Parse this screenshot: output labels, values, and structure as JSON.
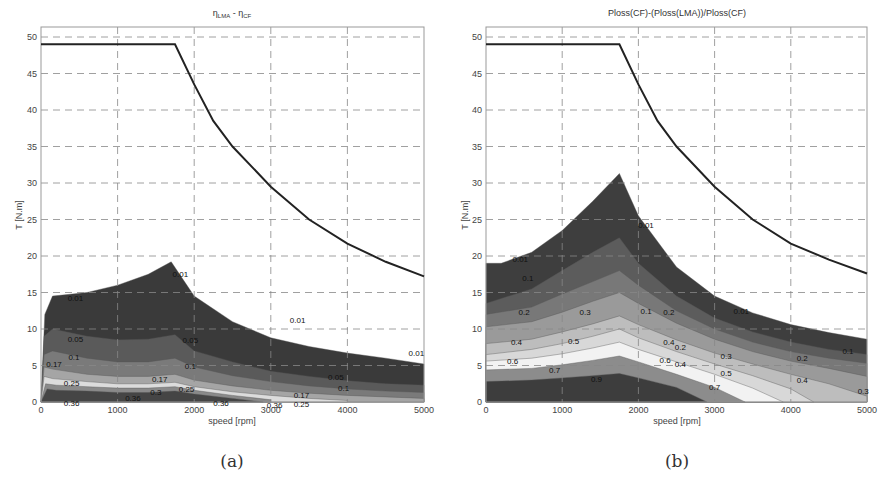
{
  "chart_data": [
    {
      "id": "a",
      "type": "contour",
      "caption": "(a)",
      "title": "η_LMA - η_CF",
      "title_main": "η",
      "title_sub1": "LMA",
      "title_mid": " - η",
      "title_sub2": "CF",
      "xlabel": "speed [rpm]",
      "ylabel": "T [N.m]",
      "xlim": [
        0,
        5000
      ],
      "ylim": [
        0,
        52
      ],
      "xticks": [
        0,
        1000,
        2000,
        3000,
        4000,
        5000
      ],
      "yticks": [
        0,
        5,
        10,
        15,
        20,
        25,
        30,
        35,
        40,
        45,
        50
      ],
      "grid": true,
      "torque_limit": {
        "speed": [
          0,
          1750,
          2000,
          2250,
          2500,
          3000,
          3500,
          4000,
          4500,
          5000
        ],
        "torque": [
          49,
          49,
          43.5,
          38.5,
          35,
          29.5,
          25,
          21.7,
          19.2,
          17.2
        ]
      },
      "levels": [
        0.01,
        0.05,
        0.1,
        0.17,
        0.25,
        0.3,
        0.36
      ],
      "bands": [
        {
          "level": 0.01,
          "color": "#3a3a3a",
          "speed": [
            0,
            50,
            150,
            600,
            1000,
            1400,
            1700,
            2000,
            2500,
            3000,
            3500,
            4000,
            4500,
            5000
          ],
          "torque": [
            0,
            12,
            14.5,
            15,
            16,
            17.5,
            19.2,
            14.5,
            11,
            8.8,
            7.6,
            6.7,
            6.0,
            5.2
          ]
        },
        {
          "level": 0.05,
          "color": "#5a5a5a",
          "speed": [
            0,
            40,
            150,
            600,
            1000,
            1400,
            1750,
            2000,
            2500,
            3000,
            3500,
            4000,
            4500,
            5000
          ],
          "torque": [
            0,
            9,
            10,
            9,
            8.5,
            8.6,
            9.2,
            7,
            5.5,
            4.2,
            3.5,
            2.9,
            2.5,
            2.3
          ]
        },
        {
          "level": 0.1,
          "color": "#7a7a7a",
          "speed": [
            0,
            40,
            150,
            600,
            1000,
            1400,
            1750,
            2000,
            2500,
            3000,
            3500,
            4000,
            4500,
            5000
          ],
          "torque": [
            0,
            6.5,
            7,
            6,
            5.5,
            5.5,
            6,
            4.8,
            3.6,
            2.8,
            2.2,
            1.8,
            1.5,
            1.3
          ]
        },
        {
          "level": 0.17,
          "color": "#a5a5a5",
          "speed": [
            0,
            40,
            150,
            600,
            1000,
            1400,
            1750,
            2000,
            2500,
            3000,
            3500,
            4000,
            4500,
            5000
          ],
          "torque": [
            0,
            4.8,
            4.5,
            3.8,
            3.5,
            3.5,
            3.8,
            3,
            2.2,
            1.6,
            1.2,
            0.9,
            0.7,
            0.5
          ]
        },
        {
          "level": 0.25,
          "color": "#dcdcdc",
          "speed": [
            0,
            40,
            150,
            600,
            1000,
            1400,
            1750,
            2000,
            2500,
            3000,
            3500,
            4000
          ],
          "torque": [
            0,
            3.5,
            3.2,
            2.8,
            2.5,
            2.5,
            2.7,
            2.1,
            1.4,
            0.9,
            0.5,
            0.2
          ]
        },
        {
          "level": 0.3,
          "color": "#8a8a8a",
          "speed": [
            0,
            60,
            200,
            600,
            1000,
            1400,
            1750,
            2000,
            2500,
            3000
          ],
          "torque": [
            0,
            2.5,
            2.3,
            2.1,
            1.9,
            1.9,
            2.1,
            1.6,
            0.9,
            0.3
          ]
        },
        {
          "level": 0.36,
          "color": "#454545",
          "speed": [
            0,
            80,
            200,
            600,
            1000,
            1400,
            1750,
            2000,
            2500,
            2900
          ],
          "torque": [
            0,
            1.8,
            1.6,
            1.5,
            1.3,
            1.3,
            1.5,
            1.1,
            0.5,
            0.0
          ]
        }
      ],
      "contour_labels": [
        {
          "text": "0.01",
          "speed": 450,
          "torque": 14.3
        },
        {
          "text": "0.01",
          "speed": 1820,
          "torque": 17.5
        },
        {
          "text": "0.01",
          "speed": 3350,
          "torque": 11.3
        },
        {
          "text": "0.01",
          "speed": 4900,
          "torque": 6.7
        },
        {
          "text": "0.05",
          "speed": 450,
          "torque": 8.6
        },
        {
          "text": "0.05",
          "speed": 1950,
          "torque": 8.5
        },
        {
          "text": "0.05",
          "speed": 3850,
          "torque": 3.4
        },
        {
          "text": "0.1",
          "speed": 430,
          "torque": 6.1
        },
        {
          "text": "0.1",
          "speed": 1950,
          "torque": 5.0
        },
        {
          "text": "0.1",
          "speed": 3950,
          "torque": 1.9
        },
        {
          "text": "0.17",
          "speed": 170,
          "torque": 5.2
        },
        {
          "text": "0.17",
          "speed": 1550,
          "torque": 3.1
        },
        {
          "text": "0.17",
          "speed": 3400,
          "torque": 0.9
        },
        {
          "text": "0.25",
          "speed": 400,
          "torque": 2.6
        },
        {
          "text": "0.25",
          "speed": 1900,
          "torque": 1.8
        },
        {
          "text": "0.25",
          "speed": 3400,
          "torque": -0.3
        },
        {
          "text": "0.3",
          "speed": 1500,
          "torque": 1.4
        },
        {
          "text": "0.36",
          "speed": 1200,
          "torque": 0.6
        },
        {
          "text": "0.36",
          "speed": 2350,
          "torque": -0.1
        },
        {
          "text": "0.36",
          "speed": 400,
          "torque": -0.2
        },
        {
          "text": "0.36",
          "speed": 3050,
          "torque": -0.4
        }
      ]
    },
    {
      "id": "b",
      "type": "contour",
      "caption": "(b)",
      "title": "Ploss(CF)-(Ploss(LMA))/Ploss(CF)",
      "xlabel": "speed [rpm]",
      "ylabel": "T [N.m]",
      "xlim": [
        0,
        5000
      ],
      "ylim": [
        0,
        52
      ],
      "xticks": [
        0,
        1000,
        2000,
        3000,
        4000,
        5000
      ],
      "yticks": [
        0,
        5,
        10,
        15,
        20,
        25,
        30,
        35,
        40,
        45,
        50
      ],
      "grid": true,
      "torque_limit": {
        "speed": [
          0,
          1750,
          2000,
          2250,
          2500,
          3000,
          3500,
          4000,
          4500,
          5000
        ],
        "torque": [
          49,
          49,
          43.5,
          38.5,
          35,
          29.5,
          25,
          21.7,
          19.5,
          17.6
        ]
      },
      "levels": [
        0.01,
        0.1,
        0.2,
        0.3,
        0.4,
        0.5,
        0.6,
        0.7,
        0.9
      ],
      "bands": [
        {
          "level": 0.01,
          "color": "#3e3e3e",
          "speed": [
            0,
            200,
            600,
            1000,
            1400,
            1750,
            2000,
            2500,
            3000,
            3500,
            4000,
            4500,
            5000
          ],
          "torque": [
            19,
            19,
            20.5,
            23.5,
            27.5,
            31.3,
            25.5,
            18.5,
            14.5,
            12.2,
            10.6,
            9.5,
            8.6
          ]
        },
        {
          "level": 0.1,
          "color": "#5c5c5c",
          "speed": [
            0,
            600,
            1000,
            1400,
            1750,
            2000,
            2500,
            3000,
            3500,
            4000,
            4500,
            5000
          ],
          "torque": [
            13.5,
            15.5,
            18,
            20.5,
            22.5,
            19,
            14.5,
            11.5,
            9.6,
            8.2,
            7.2,
            6.5
          ]
        },
        {
          "level": 0.2,
          "color": "#787878",
          "speed": [
            0,
            600,
            1000,
            1400,
            1750,
            2000,
            2500,
            3000,
            3500,
            4000,
            4500,
            5000
          ],
          "torque": [
            12,
            13,
            14.8,
            16.5,
            18,
            16,
            12.5,
            10,
            8.2,
            6.9,
            6.0,
            5.3
          ]
        },
        {
          "level": 0.3,
          "color": "#9a9a9a",
          "speed": [
            0,
            600,
            1000,
            1400,
            1750,
            2000,
            2500,
            3000,
            3500,
            4000,
            4500,
            5000
          ],
          "torque": [
            10.3,
            11,
            12.3,
            13.8,
            15,
            13.5,
            10.8,
            8.6,
            6.9,
            5.6,
            4.6,
            3.5
          ]
        },
        {
          "level": 0.4,
          "color": "#bdbdbd",
          "speed": [
            0,
            600,
            1000,
            1400,
            1750,
            2000,
            2500,
            3000,
            3500,
            4000,
            4500,
            5000
          ],
          "torque": [
            8,
            8.6,
            9.6,
            10.7,
            11.8,
            10.6,
            8.5,
            6.7,
            5.2,
            3.8,
            2.5,
            0.8
          ]
        },
        {
          "level": 0.5,
          "color": "#d8d8d8",
          "speed": [
            0,
            600,
            1000,
            1400,
            1750,
            2000,
            2500,
            3000,
            3500,
            4000,
            4300
          ],
          "torque": [
            6.5,
            7.2,
            8,
            9,
            10,
            8.8,
            6.9,
            5.2,
            3.6,
            1.8,
            0
          ]
        },
        {
          "level": 0.6,
          "color": "#f2f2f2",
          "speed": [
            0,
            600,
            1000,
            1400,
            1750,
            2000,
            2500,
            3000,
            3500,
            3900
          ],
          "torque": [
            5.6,
            6,
            6.6,
            7.4,
            8.2,
            7.2,
            5.5,
            3.8,
            1.9,
            0
          ]
        },
        {
          "level": 0.7,
          "color": "#8c8c8c",
          "speed": [
            0,
            600,
            1000,
            1400,
            1750,
            2000,
            2500,
            3000,
            3400
          ],
          "torque": [
            4.4,
            4.6,
            5.1,
            5.7,
            6.3,
            5.5,
            3.8,
            2.0,
            0
          ]
        },
        {
          "level": 0.9,
          "color": "#3d3d3d",
          "speed": [
            0,
            600,
            1000,
            1400,
            1750,
            2000,
            2500,
            2900
          ],
          "torque": [
            2.8,
            3,
            3.3,
            3.6,
            3.9,
            3.3,
            2.0,
            0
          ]
        }
      ],
      "contour_labels": [
        {
          "text": "0.01",
          "speed": 450,
          "torque": 19.6
        },
        {
          "text": "0.01",
          "speed": 2100,
          "torque": 24.3
        },
        {
          "text": "0.01",
          "speed": 3350,
          "torque": 12.5
        },
        {
          "text": "0.1",
          "speed": 550,
          "torque": 17.0
        },
        {
          "text": "0.1",
          "speed": 2100,
          "torque": 12.5
        },
        {
          "text": "0.1",
          "speed": 4750,
          "torque": 7.0
        },
        {
          "text": "0.2",
          "speed": 500,
          "torque": 12.3
        },
        {
          "text": "0.2",
          "speed": 2400,
          "torque": 12.3
        },
        {
          "text": "0.2",
          "speed": 2550,
          "torque": 7.6
        },
        {
          "text": "0.2",
          "speed": 4150,
          "torque": 6.0
        },
        {
          "text": "0.3",
          "speed": 1300,
          "torque": 12.3
        },
        {
          "text": "0.3",
          "speed": 3150,
          "torque": 6.3
        },
        {
          "text": "0.4",
          "speed": 400,
          "torque": 8.2
        },
        {
          "text": "0.4",
          "speed": 2400,
          "torque": 8.2
        },
        {
          "text": "0.4",
          "speed": 2550,
          "torque": 5.2
        },
        {
          "text": "0.4",
          "speed": 4150,
          "torque": 3.0
        },
        {
          "text": "0.5",
          "speed": 1150,
          "torque": 8.4
        },
        {
          "text": "0.5",
          "speed": 3150,
          "torque": 4.0
        },
        {
          "text": "0.6",
          "speed": 350,
          "torque": 5.6
        },
        {
          "text": "0.6",
          "speed": 2350,
          "torque": 5.8
        },
        {
          "text": "0.7",
          "speed": 900,
          "torque": 4.4
        },
        {
          "text": "0.7",
          "speed": 3000,
          "torque": 2.0
        },
        {
          "text": "0.9",
          "speed": 1450,
          "torque": 3.2
        },
        {
          "text": "0.3",
          "speed": 4950,
          "torque": 1.5
        }
      ]
    }
  ],
  "captions": {
    "a": "(a)",
    "b": "(b)"
  }
}
